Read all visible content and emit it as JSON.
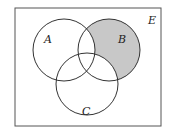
{
  "diagram": {
    "type": "venn",
    "universe_label": "E",
    "sets": [
      {
        "id": "A",
        "label": "A"
      },
      {
        "id": "B",
        "label": "B"
      },
      {
        "id": "C",
        "label": "C"
      }
    ],
    "shaded_region": "B only (B minus A and C)",
    "colors": {
      "shade": "#c8c8c8",
      "stroke": "#333333",
      "background": "#ffffff"
    }
  }
}
